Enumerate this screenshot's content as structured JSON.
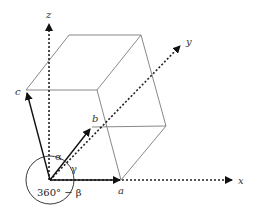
{
  "diagram": {
    "axes": {
      "x": {
        "label": "x"
      },
      "y": {
        "label": "y"
      },
      "z": {
        "label": "z"
      }
    },
    "vectors": {
      "a": {
        "label": "a"
      },
      "b": {
        "label": "b"
      },
      "c": {
        "label": "c"
      }
    },
    "angles": {
      "alpha": {
        "label": "α"
      },
      "gamma": {
        "label": "γ"
      },
      "beta_complement": {
        "label": "360° − β"
      }
    },
    "colors": {
      "cell_edge": "#7a7a7a",
      "vector": "#111111",
      "axis": "#222222",
      "text": "#333333",
      "background": "#ffffff"
    }
  }
}
